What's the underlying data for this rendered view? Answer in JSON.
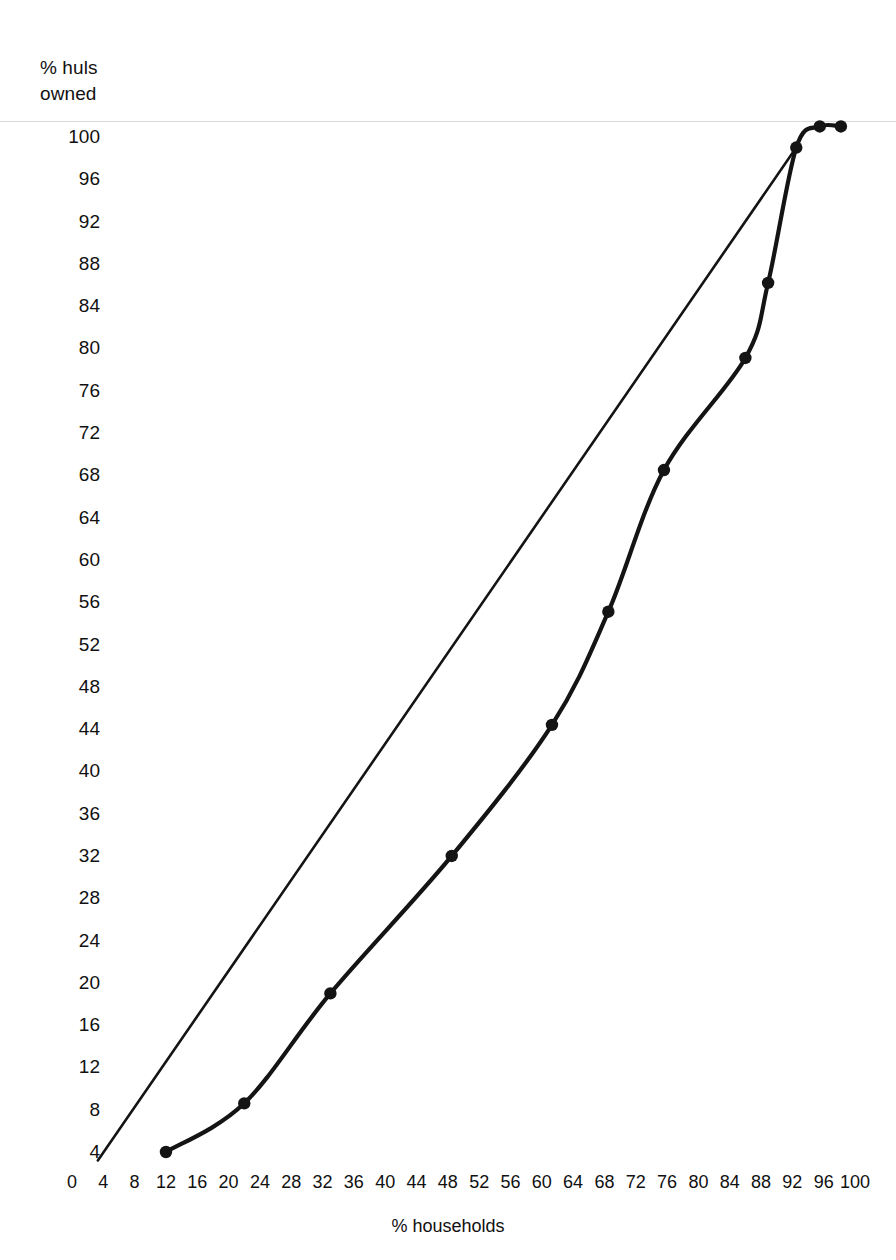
{
  "chart_data": {
    "type": "line",
    "title": "",
    "subtitle": "",
    "ylabel": "% huls\nowned",
    "ylabel_text": "% huls owned",
    "xlabel": "% households",
    "xlim": [
      0,
      100
    ],
    "ylim": [
      0,
      100
    ],
    "grid": false,
    "legend": "none",
    "xticks": [
      0,
      4,
      8,
      12,
      16,
      20,
      24,
      28,
      32,
      36,
      40,
      44,
      48,
      52,
      56,
      60,
      64,
      68,
      72,
      76,
      80,
      84,
      88,
      92,
      96,
      100
    ],
    "yticks": [
      4,
      8,
      12,
      16,
      20,
      24,
      28,
      32,
      36,
      40,
      44,
      48,
      52,
      56,
      60,
      64,
      68,
      72,
      76,
      80,
      84,
      88,
      92,
      96,
      100
    ],
    "series": [
      {
        "name": "Lorenz curve",
        "marker": "filled-circle",
        "points": [
          {
            "x": 12.0,
            "y": 4.0
          },
          {
            "x": 22.0,
            "y": 8.6
          },
          {
            "x": 33.0,
            "y": 19.0
          },
          {
            "x": 48.5,
            "y": 32.0
          },
          {
            "x": 61.3,
            "y": 44.4
          },
          {
            "x": 68.5,
            "y": 55.1
          },
          {
            "x": 75.6,
            "y": 68.5
          },
          {
            "x": 86.0,
            "y": 79.1
          },
          {
            "x": 88.9,
            "y": 86.2
          },
          {
            "x": 92.5,
            "y": 99.0
          },
          {
            "x": 95.5,
            "y": 101.0
          },
          {
            "x": 98.2,
            "y": 101.0
          }
        ]
      },
      {
        "name": "Line of equality",
        "marker": "none",
        "points": [
          {
            "x": 3.3,
            "y": 3.2
          },
          {
            "x": 92.5,
            "y": 99.0
          }
        ]
      }
    ]
  },
  "axes": {
    "y_title_line1": "% huls",
    "y_title_line2": "owned",
    "x_title": "% households"
  }
}
